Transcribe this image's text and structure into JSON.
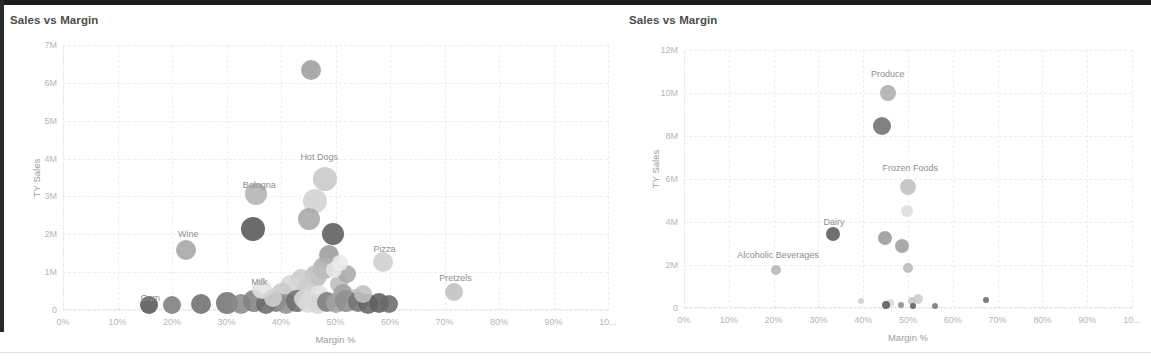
{
  "panels": [
    {
      "id": "left",
      "title": "Sales vs Margin",
      "chart_data": {
        "type": "scatter",
        "title": "Sales vs Margin",
        "xlabel": "Margin %",
        "ylabel": "TY Sales",
        "xlim": [
          0,
          100
        ],
        "ylim": [
          0,
          7000000
        ],
        "grid": true,
        "legend": "none",
        "xticks": [
          "0%",
          "10%",
          "20%",
          "30%",
          "40%",
          "50%",
          "60%",
          "70%",
          "80%",
          "90%",
          "10..."
        ],
        "xtickvals": [
          0,
          10,
          20,
          30,
          40,
          50,
          60,
          70,
          80,
          90,
          100
        ],
        "yticks": [
          "0",
          "1M",
          "2M",
          "3M",
          "4M",
          "5M",
          "6M",
          "7M"
        ],
        "ytickvals": [
          0,
          1000000,
          2000000,
          3000000,
          4000000,
          5000000,
          6000000,
          7000000
        ],
        "annotations": [
          {
            "text": "Hot Dogs",
            "x": 47,
            "y": 4050000
          },
          {
            "text": "Bologna",
            "x": 36,
            "y": 3300000
          },
          {
            "text": "Wine",
            "x": 23,
            "y": 2000000
          },
          {
            "text": "Pizza",
            "x": 59,
            "y": 1600000
          },
          {
            "text": "Pretzels",
            "x": 72,
            "y": 850000
          },
          {
            "text": "Milk",
            "x": 36,
            "y": 750000
          },
          {
            "text": "Gum",
            "x": 16,
            "y": 320000
          }
        ],
        "points": [
          {
            "x": 45.5,
            "y": 6350000,
            "r": 10,
            "c": "#9e9e9e"
          },
          {
            "x": 48.0,
            "y": 3450000,
            "r": 12,
            "c": "#c8c8c8"
          },
          {
            "x": 35.5,
            "y": 3070000,
            "r": 11,
            "c": "#b4b4b4"
          },
          {
            "x": 46.3,
            "y": 2880000,
            "r": 12,
            "c": "#d2d2d2"
          },
          {
            "x": 45.2,
            "y": 2400000,
            "r": 11,
            "c": "#a9a9a9"
          },
          {
            "x": 34.8,
            "y": 2150000,
            "r": 12,
            "c": "#565656"
          },
          {
            "x": 49.5,
            "y": 2020000,
            "r": 11,
            "c": "#5c5c5c"
          },
          {
            "x": 22.6,
            "y": 1580000,
            "r": 10,
            "c": "#a5a5a5"
          },
          {
            "x": 58.8,
            "y": 1280000,
            "r": 10,
            "c": "#cfcfcf"
          },
          {
            "x": 48.8,
            "y": 1460000,
            "r": 10,
            "c": "#9b9b9b"
          },
          {
            "x": 47.8,
            "y": 1120000,
            "r": 11,
            "c": "#b0b0b0"
          },
          {
            "x": 46.4,
            "y": 900000,
            "r": 11,
            "c": "#bdbdbd"
          },
          {
            "x": 71.8,
            "y": 470000,
            "r": 9,
            "c": "#c0c0c0"
          },
          {
            "x": 43.6,
            "y": 830000,
            "r": 10,
            "c": "#cbcbcb"
          },
          {
            "x": 41.8,
            "y": 640000,
            "r": 11,
            "c": "#d5d5d5"
          },
          {
            "x": 40.2,
            "y": 430000,
            "r": 11,
            "c": "#c9c9c9"
          },
          {
            "x": 44.6,
            "y": 520000,
            "r": 10,
            "c": "#cdcdcd"
          },
          {
            "x": 47.0,
            "y": 400000,
            "r": 10,
            "c": "#e0e0e0"
          },
          {
            "x": 50.6,
            "y": 700000,
            "r": 9,
            "c": "#bcbcbc"
          },
          {
            "x": 52.2,
            "y": 950000,
            "r": 9,
            "c": "#a8a8a8"
          },
          {
            "x": 51.4,
            "y": 430000,
            "r": 10,
            "c": "#9f9f9f"
          },
          {
            "x": 53.6,
            "y": 330000,
            "r": 9,
            "c": "#c4c4c4"
          },
          {
            "x": 15.8,
            "y": 130000,
            "r": 9,
            "c": "#585858"
          },
          {
            "x": 20.0,
            "y": 120000,
            "r": 9,
            "c": "#7d7d7d"
          },
          {
            "x": 25.3,
            "y": 150000,
            "r": 10,
            "c": "#6f6f6f"
          },
          {
            "x": 30.0,
            "y": 190000,
            "r": 11,
            "c": "#747474"
          },
          {
            "x": 32.6,
            "y": 170000,
            "r": 10,
            "c": "#8b8b8b"
          },
          {
            "x": 35.0,
            "y": 230000,
            "r": 11,
            "c": "#828282"
          },
          {
            "x": 37.2,
            "y": 170000,
            "r": 10,
            "c": "#6b6b6b"
          },
          {
            "x": 39.0,
            "y": 200000,
            "r": 10,
            "c": "#7a7a7a"
          },
          {
            "x": 41.0,
            "y": 160000,
            "r": 10,
            "c": "#909090"
          },
          {
            "x": 43.0,
            "y": 230000,
            "r": 11,
            "c": "#6e6e6e"
          },
          {
            "x": 45.0,
            "y": 180000,
            "r": 10,
            "c": "#dcdcdc"
          },
          {
            "x": 46.8,
            "y": 160000,
            "r": 10,
            "c": "#d6d6d6"
          },
          {
            "x": 48.4,
            "y": 210000,
            "r": 10,
            "c": "#7b7b7b"
          },
          {
            "x": 50.0,
            "y": 180000,
            "r": 10,
            "c": "#a2a2a2"
          },
          {
            "x": 52.0,
            "y": 240000,
            "r": 11,
            "c": "#8e8e8e"
          },
          {
            "x": 54.2,
            "y": 200000,
            "r": 10,
            "c": "#737373"
          },
          {
            "x": 56.0,
            "y": 170000,
            "r": 10,
            "c": "#666666"
          },
          {
            "x": 58.0,
            "y": 190000,
            "r": 10,
            "c": "#5f5f5f"
          },
          {
            "x": 59.8,
            "y": 160000,
            "r": 9,
            "c": "#6a6a6a"
          },
          {
            "x": 36.5,
            "y": 560000,
            "r": 10,
            "c": "#e2e2e2"
          },
          {
            "x": 38.5,
            "y": 320000,
            "r": 9,
            "c": "#d0d0d0"
          },
          {
            "x": 49.8,
            "y": 1050000,
            "r": 8,
            "c": "#e6e6e6"
          },
          {
            "x": 50.8,
            "y": 1250000,
            "r": 8,
            "c": "#eaeaea"
          },
          {
            "x": 55.0,
            "y": 420000,
            "r": 9,
            "c": "#bfbfbf"
          },
          {
            "x": 44.0,
            "y": 300000,
            "r": 9,
            "c": "#dadada"
          }
        ]
      }
    },
    {
      "id": "right",
      "title": "Sales vs Margin",
      "chart_data": {
        "type": "scatter",
        "title": "Sales vs Margin",
        "xlabel": "Margin %",
        "ylabel": "TY Sales",
        "xlim": [
          0,
          100
        ],
        "ylim": [
          0,
          12000000
        ],
        "grid": true,
        "legend": "none",
        "xticks": [
          "0%",
          "10%",
          "20%",
          "30%",
          "40%",
          "50%",
          "60%",
          "70%",
          "80%",
          "90%",
          "10..."
        ],
        "xtickvals": [
          0,
          10,
          20,
          30,
          40,
          50,
          60,
          70,
          80,
          90,
          100
        ],
        "yticks": [
          "0",
          "2M",
          "4M",
          "6M",
          "8M",
          "10M",
          "12M"
        ],
        "ytickvals": [
          0,
          2000000,
          4000000,
          6000000,
          8000000,
          10000000,
          12000000
        ],
        "annotations": [
          {
            "text": "Produce",
            "x": 45.5,
            "y": 10900000
          },
          {
            "text": "Frozen Foods",
            "x": 50.5,
            "y": 6500000
          },
          {
            "text": "Dairy",
            "x": 33.5,
            "y": 4000000
          },
          {
            "text": "Alcoholic Beverages",
            "x": 21.0,
            "y": 2450000
          }
        ],
        "points": [
          {
            "x": 45.5,
            "y": 10000000,
            "r": 8,
            "c": "#adadad"
          },
          {
            "x": 44.2,
            "y": 8450000,
            "r": 9,
            "c": "#6f6f6f"
          },
          {
            "x": 50.0,
            "y": 5650000,
            "r": 8,
            "c": "#c0c0c0"
          },
          {
            "x": 49.8,
            "y": 4500000,
            "r": 6,
            "c": "#dddddd"
          },
          {
            "x": 33.2,
            "y": 3450000,
            "r": 7,
            "c": "#5b5b5b"
          },
          {
            "x": 44.8,
            "y": 3250000,
            "r": 7,
            "c": "#9a9a9a"
          },
          {
            "x": 48.6,
            "y": 2900000,
            "r": 7,
            "c": "#9e9e9e"
          },
          {
            "x": 20.5,
            "y": 1750000,
            "r": 5,
            "c": "#b6b6b6"
          },
          {
            "x": 50.0,
            "y": 1850000,
            "r": 5,
            "c": "#b9b9b9"
          },
          {
            "x": 46.0,
            "y": 250000,
            "r": 4,
            "c": "#d8d8d8"
          },
          {
            "x": 50.8,
            "y": 320000,
            "r": 4,
            "c": "#c6c6c6"
          },
          {
            "x": 52.2,
            "y": 420000,
            "r": 5,
            "c": "#cdcdcd"
          },
          {
            "x": 45.2,
            "y": 120000,
            "r": 4,
            "c": "#5a5a5a"
          },
          {
            "x": 48.5,
            "y": 120000,
            "r": 3,
            "c": "#8c8c8c"
          },
          {
            "x": 51.2,
            "y": 110000,
            "r": 3,
            "c": "#5e5e5e"
          },
          {
            "x": 56.0,
            "y": 110000,
            "r": 3,
            "c": "#787878"
          },
          {
            "x": 39.5,
            "y": 330000,
            "r": 3,
            "c": "#cfcfcf"
          },
          {
            "x": 67.5,
            "y": 380000,
            "r": 3,
            "c": "#6c6c6c"
          }
        ]
      }
    }
  ]
}
